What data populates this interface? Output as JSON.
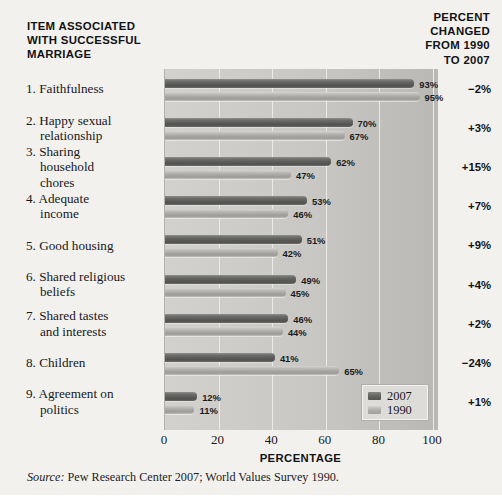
{
  "header": {
    "left_title": "ITEM ASSOCIATED\nWITH SUCCESSFUL\nMARRIAGE",
    "right_title": "PERCENT\nCHANGED\nFROM 1990\nTO 2007"
  },
  "source": {
    "label": "Source:",
    "text": " Pew Research Center 2007; World Values Survey 1990."
  },
  "legend": {
    "entries": [
      {
        "name": "2007",
        "color": "#5e5e5c"
      },
      {
        "name": "1990",
        "color": "#a9a8a4"
      }
    ]
  },
  "chart_data": {
    "type": "bar",
    "orientation": "horizontal",
    "title": "",
    "xlabel": "PERCENTAGE",
    "ylabel": "",
    "xlim": [
      0,
      100
    ],
    "xticks": [
      "0",
      "20",
      "40",
      "60",
      "80",
      "100"
    ],
    "grid": true,
    "legend_position": "bottom-right",
    "categories": [
      "1. Faithfulness",
      "2. Happy sexual relationship",
      "3. Sharing household chores",
      "4. Adequate income",
      "5. Good housing",
      "6. Shared religious beliefs",
      "7. Shared tastes and interests",
      "8. Children",
      "9. Agreement on politics"
    ],
    "category_lines": [
      [
        "1. Faithfulness"
      ],
      [
        "2. Happy sexual",
        "relationship"
      ],
      [
        "3. Sharing",
        "household",
        "chores"
      ],
      [
        "4. Adequate",
        "income"
      ],
      [
        "5. Good housing"
      ],
      [
        "6. Shared religious",
        "beliefs"
      ],
      [
        "7. Shared tastes",
        "and interests"
      ],
      [
        "8. Children"
      ],
      [
        "9. Agreement on",
        "politics"
      ]
    ],
    "series": [
      {
        "name": "2007",
        "values": [
          93,
          70,
          62,
          53,
          51,
          49,
          46,
          41,
          12
        ],
        "labels": [
          "93%",
          "70%",
          "62%",
          "53%",
          "51%",
          "49%",
          "46%",
          "41%",
          "12%"
        ]
      },
      {
        "name": "1990",
        "values": [
          95,
          67,
          47,
          46,
          42,
          45,
          44,
          65,
          11
        ],
        "labels": [
          "95%",
          "67%",
          "47%",
          "46%",
          "42%",
          "45%",
          "44%",
          "65%",
          "11%"
        ]
      }
    ],
    "percent_change": [
      "−2%",
      "+3%",
      "+15%",
      "+7%",
      "+9%",
      "+4%",
      "+2%",
      "−24%",
      "+1%"
    ]
  }
}
